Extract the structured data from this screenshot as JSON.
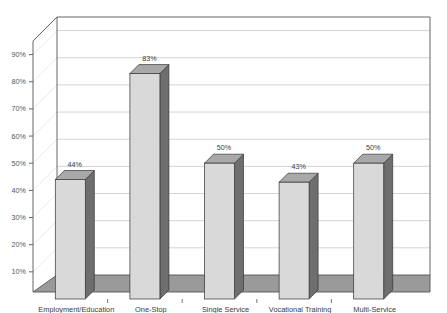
{
  "chart_data": {
    "type": "bar",
    "title": "",
    "subtitle": "",
    "xlabel": "",
    "ylabel": "",
    "categories": [
      "Employment/Education",
      "One-Stop",
      "Single Service",
      "Vocational Training",
      "Multi-Service"
    ],
    "values": [
      44,
      83,
      50,
      43,
      50
    ],
    "value_labels": [
      "44%",
      "83%",
      "50%",
      "43%",
      "50%"
    ],
    "ylim": [
      0,
      95
    ],
    "ytick_values": [
      10,
      20,
      30,
      40,
      50,
      60,
      70,
      80,
      90
    ],
    "ytick_labels": [
      "10%",
      "20%",
      "30%",
      "40%",
      "50%",
      "60%",
      "70%",
      "80%",
      "90%"
    ],
    "grid": true,
    "legend": false,
    "three_d": true,
    "series": [
      {
        "name": "Percent",
        "values": [
          44,
          83,
          50,
          43,
          50
        ]
      }
    ]
  },
  "style": {
    "background": "#ffffff",
    "bar_front": "#d9d9d9",
    "bar_side": "#6e6e6e",
    "bar_top": "#a8a8a8",
    "bar_outline": "#333333",
    "floor": "#9a9a9a",
    "wall": "#ffffff",
    "gridline": "#c9c9c9",
    "axis_line": "#555555",
    "tick_text": "#555555",
    "label_text": "#3a3a3a"
  },
  "title_fragment": ""
}
